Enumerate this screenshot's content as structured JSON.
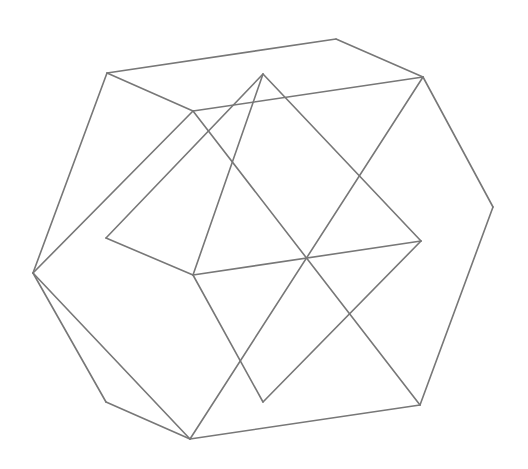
{
  "figure": {
    "stroke_color": "#777777",
    "background": "#ffffff"
  },
  "vertices": {
    "A": [
      107,
      73
    ],
    "B": [
      336,
      39
    ],
    "C": [
      423,
      77
    ],
    "D": [
      493,
      207
    ],
    "E": [
      420,
      405
    ],
    "F": [
      190,
      439
    ],
    "G": [
      106,
      402
    ],
    "H": [
      33,
      273
    ],
    "I": [
      193,
      111
    ],
    "J": [
      263,
      74
    ],
    "K": [
      106,
      238
    ],
    "L": [
      421,
      241
    ],
    "M": [
      193,
      275
    ],
    "N": [
      263,
      402
    ]
  },
  "edges": [
    [
      "A",
      "B"
    ],
    [
      "B",
      "C"
    ],
    [
      "C",
      "D"
    ],
    [
      "D",
      "E"
    ],
    [
      "E",
      "F"
    ],
    [
      "F",
      "G"
    ],
    [
      "G",
      "H"
    ],
    [
      "H",
      "A"
    ],
    [
      "A",
      "I"
    ],
    [
      "I",
      "C"
    ],
    [
      "I",
      "H"
    ],
    [
      "I",
      "E"
    ],
    [
      "J",
      "K"
    ],
    [
      "J",
      "M"
    ],
    [
      "J",
      "L"
    ],
    [
      "K",
      "M"
    ],
    [
      "M",
      "L"
    ],
    [
      "M",
      "N"
    ],
    [
      "N",
      "L"
    ],
    [
      "C",
      "F"
    ],
    [
      "H",
      "F"
    ]
  ]
}
